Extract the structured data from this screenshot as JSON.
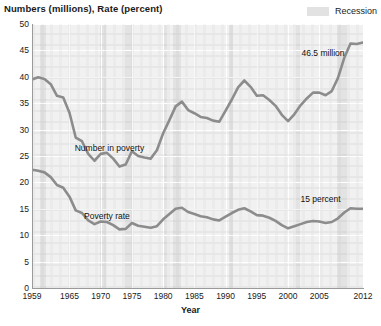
{
  "header": {
    "axis_title_top": "Numbers (millions), Rate (percent)",
    "legend": {
      "swatch_name": "recession-swatch",
      "label": "Recession",
      "color": "#e3e3e3"
    }
  },
  "axes": {
    "x_title": "Year",
    "y_ticks": [
      "0",
      "5",
      "10",
      "15",
      "20",
      "25",
      "30",
      "35",
      "40",
      "45",
      "50"
    ],
    "x_ticks": [
      "1959",
      "1965",
      "1970",
      "1975",
      "1980",
      "1985",
      "1990",
      "1995",
      "2000",
      "2005",
      "2012"
    ]
  },
  "annotations": [
    {
      "name": "number-in-poverty-label",
      "text": "Number in poverty",
      "x": 1971.4,
      "y": 26.6
    },
    {
      "name": "poverty-rate-label",
      "text": "Poverty rate",
      "x": 1971.0,
      "y": 13.6
    },
    {
      "name": "value-46-5-million",
      "text": "46.5 million",
      "x": 2005.6,
      "y": 44.6
    },
    {
      "name": "value-15-percent",
      "text": "15 percent",
      "x": 2005.2,
      "y": 16.9
    }
  ],
  "chart_data": {
    "type": "line",
    "title": "Numbers (millions), Rate (percent)",
    "xlabel": "Year",
    "ylabel": "Numbers (millions), Rate (percent)",
    "xlim": [
      1959,
      2012
    ],
    "ylim": [
      0,
      50
    ],
    "grid": true,
    "legend_position": "top-right",
    "line_color": "#8c8c8c",
    "background_color": "#f1f1f1",
    "gridline_color": "#ffffff",
    "x": [
      1959,
      1960,
      1961,
      1962,
      1963,
      1964,
      1965,
      1966,
      1967,
      1968,
      1969,
      1970,
      1971,
      1972,
      1973,
      1974,
      1975,
      1976,
      1977,
      1978,
      1979,
      1980,
      1981,
      1982,
      1983,
      1984,
      1985,
      1986,
      1987,
      1988,
      1989,
      1990,
      1991,
      1992,
      1993,
      1994,
      1995,
      1996,
      1997,
      1998,
      1999,
      2000,
      2001,
      2002,
      2003,
      2004,
      2005,
      2006,
      2007,
      2008,
      2009,
      2010,
      2011,
      2012
    ],
    "series": [
      {
        "name": "Number in poverty",
        "unit": "millions",
        "values": [
          39.5,
          39.9,
          39.6,
          38.6,
          36.4,
          36.1,
          33.2,
          28.5,
          27.8,
          25.4,
          24.1,
          25.4,
          25.6,
          24.5,
          23.0,
          23.4,
          25.9,
          25.0,
          24.7,
          24.5,
          26.1,
          29.3,
          31.8,
          34.4,
          35.3,
          33.7,
          33.1,
          32.4,
          32.2,
          31.7,
          31.5,
          33.6,
          35.7,
          38.0,
          39.3,
          38.1,
          36.4,
          36.5,
          35.6,
          34.5,
          32.8,
          31.6,
          32.9,
          34.6,
          35.9,
          37.0,
          37.0,
          36.5,
          37.3,
          39.8,
          43.6,
          46.3,
          46.2,
          46.5
        ],
        "last_value_label": "46.5 million"
      },
      {
        "name": "Poverty rate",
        "unit": "percent",
        "values": [
          22.4,
          22.2,
          21.9,
          21.0,
          19.5,
          19.0,
          17.3,
          14.7,
          14.2,
          12.8,
          12.1,
          12.6,
          12.5,
          11.9,
          11.1,
          11.2,
          12.3,
          11.8,
          11.6,
          11.4,
          11.7,
          13.0,
          14.0,
          15.0,
          15.2,
          14.4,
          14.0,
          13.6,
          13.4,
          13.0,
          12.8,
          13.5,
          14.2,
          14.8,
          15.1,
          14.5,
          13.8,
          13.7,
          13.3,
          12.7,
          11.9,
          11.3,
          11.7,
          12.1,
          12.5,
          12.7,
          12.6,
          12.3,
          12.5,
          13.2,
          14.3,
          15.1,
          15.0,
          15.0
        ],
        "last_value_label": "15 percent"
      }
    ],
    "recession_bands": [
      {
        "start": 1960.3,
        "end": 1961.2
      },
      {
        "start": 1969.9,
        "end": 1970.9
      },
      {
        "start": 1973.9,
        "end": 1975.2
      },
      {
        "start": 1980.0,
        "end": 1980.6
      },
      {
        "start": 1981.5,
        "end": 1982.9
      },
      {
        "start": 1990.6,
        "end": 1991.2
      },
      {
        "start": 2001.2,
        "end": 2001.9
      },
      {
        "start": 2007.9,
        "end": 2009.5
      }
    ]
  }
}
